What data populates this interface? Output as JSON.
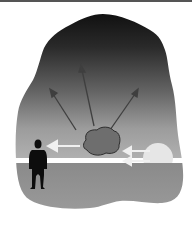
{
  "figure": {
    "colors": {
      "border_top": "#555555",
      "sky_top": "#111111",
      "sky_mid": "#5a5a5a",
      "sky_bottom": "#a9a9a9",
      "ground": "#8e8e8e",
      "ground_bottom": "#9a9a9a",
      "cloud_fill": "#6e6e6e",
      "cloud_outline": "#2e2e2e",
      "sun": "#e6e6e6",
      "arrow_light": "#f0f0f0",
      "arrow_dark": "#3f3f3f",
      "person": "#0d0d0d"
    },
    "elements": [
      {
        "name": "sky-blob"
      },
      {
        "name": "ground"
      },
      {
        "name": "sun"
      },
      {
        "name": "cloud"
      },
      {
        "name": "person-silhouette"
      },
      {
        "name": "scatter-arrows",
        "count": 3
      },
      {
        "name": "incoming-light-arrows",
        "count": 2
      },
      {
        "name": "transmitted-light-arrow",
        "count": 1
      }
    ]
  }
}
